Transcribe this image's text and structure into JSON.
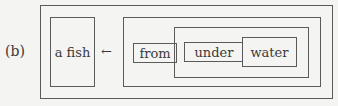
{
  "figure": {
    "label": "(b)",
    "left_box_text": "a fish",
    "arrow": "←",
    "nested_words": [
      "from",
      "under",
      "water"
    ]
  }
}
